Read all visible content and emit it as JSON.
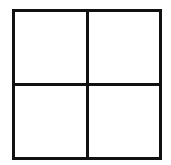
{
  "diagram": {
    "type": "grid",
    "rows": 2,
    "columns": 2,
    "line_color": "#111111",
    "background_color": "#ffffff",
    "cells": [
      {
        "row": 0,
        "col": 0,
        "content": ""
      },
      {
        "row": 0,
        "col": 1,
        "content": ""
      },
      {
        "row": 1,
        "col": 0,
        "content": ""
      },
      {
        "row": 1,
        "col": 1,
        "content": ""
      }
    ]
  }
}
